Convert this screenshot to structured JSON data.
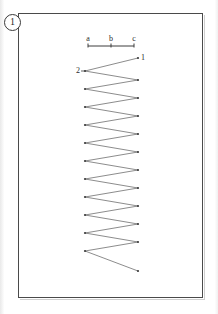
{
  "figure": {
    "number_label": "1",
    "caption_inside": "",
    "frame": {
      "x": 18,
      "y": 13,
      "width": 185,
      "height": 285
    }
  },
  "scale_bar": {
    "name": "scale-bar",
    "y": 46,
    "x_start": 88,
    "x_end": 134,
    "ticks": [
      {
        "label": "a",
        "x": 88
      },
      {
        "label": "b",
        "x": 111
      },
      {
        "label": "c",
        "x": 134
      }
    ],
    "label_y": 34
  },
  "diagram": {
    "type": "zigzag-scan-path",
    "stroke_color": "#6e6e6e",
    "vertex_color": "#3c3c3c",
    "left_x": 85,
    "right_x": 138,
    "start_point": {
      "label": "1",
      "x": 138,
      "y": 58,
      "label_x": 141,
      "label_y": 53
    },
    "second_point": {
      "label": "2",
      "x": 85,
      "y": 71,
      "label_x": 76,
      "label_y": 66
    },
    "end_point": {
      "x": 138,
      "y": 271
    },
    "left_vertices_y": [
      71,
      89,
      107,
      125,
      143,
      161,
      179,
      197,
      215,
      233,
      251
    ],
    "right_vertices_y": [
      58,
      80,
      98,
      116,
      134,
      152,
      170,
      188,
      206,
      224,
      242,
      271
    ],
    "vertex_count": 24
  },
  "chart_data": {
    "type": "line",
    "title": "",
    "xlabel": "",
    "ylabel": "",
    "series": [
      {
        "name": "scan-path",
        "points": [
          [
            138,
            58
          ],
          [
            85,
            71
          ],
          [
            138,
            80
          ],
          [
            85,
            89
          ],
          [
            138,
            98
          ],
          [
            85,
            107
          ],
          [
            138,
            116
          ],
          [
            85,
            125
          ],
          [
            138,
            134
          ],
          [
            85,
            143
          ],
          [
            138,
            152
          ],
          [
            85,
            161
          ],
          [
            138,
            170
          ],
          [
            85,
            179
          ],
          [
            138,
            188
          ],
          [
            85,
            197
          ],
          [
            138,
            206
          ],
          [
            85,
            215
          ],
          [
            138,
            224
          ],
          [
            85,
            233
          ],
          [
            138,
            242
          ],
          [
            85,
            251
          ],
          [
            138,
            271
          ]
        ]
      }
    ],
    "annotations": [
      {
        "text": "1",
        "x": 141,
        "y": 53
      },
      {
        "text": "2",
        "x": 76,
        "y": 66
      }
    ],
    "grid": false,
    "legend": "none"
  }
}
